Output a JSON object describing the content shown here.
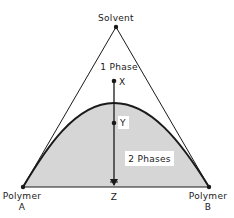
{
  "diagram": {
    "type": "ternary-phase-diagram",
    "vertices": {
      "top": {
        "label": "Solvent"
      },
      "left": {
        "label_line1": "Polymer",
        "label_line2": "A"
      },
      "right": {
        "label_line1": "Polymer",
        "label_line2": "B"
      }
    },
    "regions": {
      "one_phase": "1 Phase",
      "two_phase": "2 Phases"
    },
    "points": {
      "x": "X",
      "y": "Y",
      "z": "Z"
    },
    "colors": {
      "line": "#1a1a1a",
      "two_phase_fill": "#d6d6d6",
      "background": "#ffffff"
    }
  }
}
